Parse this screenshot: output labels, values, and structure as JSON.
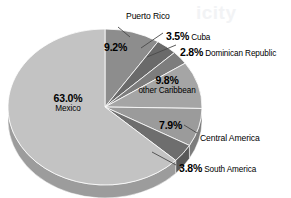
{
  "chart_data": {
    "type": "pie",
    "title": "",
    "subtitle": "",
    "xlabel": "",
    "ylabel": "",
    "legend_position": "none",
    "grid": false,
    "style": "3d-pie-grayscale",
    "unit": "percent",
    "total": 100.0,
    "categories": [
      "Puerto Rico",
      "Cuba",
      "Dominican Republic",
      "other Caribbean",
      "Central America",
      "South America",
      "Mexico"
    ],
    "values": [
      9.2,
      3.5,
      2.8,
      9.8,
      7.9,
      3.8,
      63.0
    ],
    "slices": [
      {
        "name": "Puerto Rico",
        "value": 9.2,
        "value_label": "9.2%",
        "color": "#8d8d8d",
        "side_color": "#6f6f6f",
        "label_placement": "inside-value-outside-name",
        "leader_line": true
      },
      {
        "name": "Cuba",
        "value": 3.5,
        "value_label": "3.5%",
        "color": "#6a6a6a",
        "side_color": "#545454",
        "label_placement": "outside",
        "leader_line": true
      },
      {
        "name": "Dominican Republic",
        "value": 2.8,
        "value_label": "2.8%",
        "color": "#7d7d7d",
        "side_color": "#626262",
        "label_placement": "outside",
        "leader_line": true
      },
      {
        "name": "other Caribbean",
        "value": 9.8,
        "value_label": "9.8%",
        "color": "#a5a5a5",
        "side_color": "#848484",
        "label_placement": "inside",
        "leader_line": false
      },
      {
        "name": "Central America",
        "value": 7.9,
        "value_label": "7.9%",
        "color": "#9b9b9b",
        "side_color": "#7c7c7c",
        "label_placement": "inside-value-outside-name",
        "leader_line": true
      },
      {
        "name": "South America",
        "value": 3.8,
        "value_label": "3.8%",
        "color": "#6e6e6e",
        "side_color": "#585858",
        "label_placement": "outside",
        "leader_line": true
      },
      {
        "name": "Mexico",
        "value": 63.0,
        "value_label": "63.0%",
        "color": "#c3c3c3",
        "side_color": "#9c9c9c",
        "label_placement": "inside",
        "leader_line": false
      }
    ]
  },
  "labels": {
    "puerto_rico": {
      "pct": "9.2%",
      "name": "Puerto Rico"
    },
    "cuba": {
      "pct": "3.5%",
      "name": "Cuba"
    },
    "dominican_republic": {
      "pct": "2.8%",
      "name": "Dominican Republic"
    },
    "other_caribbean": {
      "pct": "9.8%",
      "name": "other Caribbean"
    },
    "central_america": {
      "pct": "7.9%",
      "name": "Central America"
    },
    "south_america": {
      "pct": "3.8%",
      "name": "South America"
    },
    "mexico": {
      "pct": "63.0%",
      "name": "Mexico"
    }
  },
  "watermark": {
    "line1": "icity",
    "line2": "",
    "line3": ""
  },
  "colors": {
    "background": "#ffffff",
    "text": "#000000",
    "leader_line": "#4a4a4a",
    "slice_outline": "#ffffff"
  }
}
